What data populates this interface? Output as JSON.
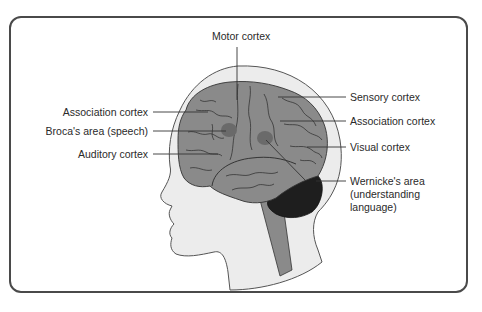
{
  "diagram": {
    "colors": {
      "frame": "#4a4a4a",
      "head_fill": "#ececec",
      "head_outline": "#555555",
      "brain_fill": "#8a8a8a",
      "brain_folds": "#2a2a2a",
      "highlight_area": "#6a6a6a",
      "cerebellum_fill": "#1e1e1e",
      "brainstem_fill": "#8a8a8a",
      "leader_line": "#333333",
      "text": "#2a2a2a"
    },
    "labels": {
      "motor_cortex": "Motor cortex",
      "sensory_cortex": "Sensory cortex",
      "association_cortex_left": "Association cortex",
      "brocas_area": "Broca's area (speech)",
      "auditory_cortex": "Auditory cortex",
      "association_cortex_right": "Association cortex",
      "visual_cortex": "Visual cortex",
      "wernickes_area": "Wernicke's area\n(understanding\nlanguage)"
    }
  }
}
